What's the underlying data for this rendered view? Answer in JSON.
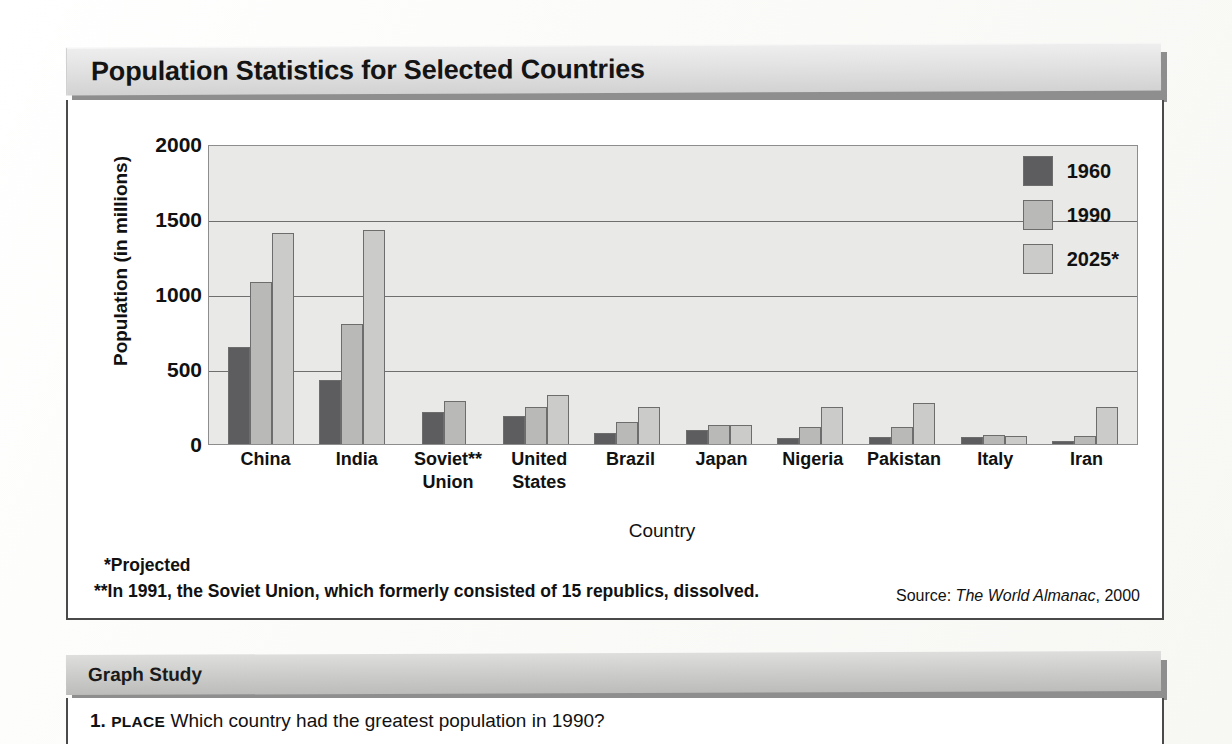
{
  "header": {
    "title": "Population Statistics for Selected Countries"
  },
  "chart_data": {
    "type": "bar",
    "title": "Population Statistics for Selected Countries",
    "xlabel": "Country",
    "ylabel": "Population (in millions)",
    "ylim": [
      0,
      2000
    ],
    "yticks": [
      2000,
      1500,
      1000,
      500,
      0
    ],
    "gridlines": [
      1500,
      1000,
      500
    ],
    "grid": true,
    "legend_position": "top-right",
    "categories": [
      "China",
      "India",
      "Soviet** Union",
      "United States",
      "Brazil",
      "Japan",
      "Nigeria",
      "Pakistan",
      "Italy",
      "Iran"
    ],
    "category_lines": [
      [
        "China"
      ],
      [
        "India"
      ],
      [
        "Soviet**",
        "Union"
      ],
      [
        "United",
        "States"
      ],
      [
        "Brazil"
      ],
      [
        "Japan"
      ],
      [
        "Nigeria"
      ],
      [
        "Pakistan"
      ],
      [
        "Italy"
      ],
      [
        "Iran"
      ]
    ],
    "series": [
      {
        "name": "1960",
        "color": "#5d5d5f",
        "values": [
          650,
          430,
          215,
          185,
          73,
          94,
          42,
          50,
          50,
          22
        ]
      },
      {
        "name": "1990",
        "color": "#b9b9b7",
        "values": [
          1080,
          800,
          290,
          250,
          150,
          124,
          115,
          113,
          58,
          56
        ]
      },
      {
        "name": "2025*",
        "color": "#cbcbc9",
        "values": [
          1410,
          1430,
          null,
          330,
          245,
          126,
          246,
          276,
          55,
          244
        ]
      }
    ]
  },
  "notes": {
    "projected": "*Projected",
    "soviet": "**In 1991, the Soviet Union, which formerly consisted of 15 republics, dissolved."
  },
  "source": {
    "prefix": "Source:",
    "title": "The World Almanac",
    "year": ", 2000"
  },
  "graph_study": {
    "heading": "Graph Study",
    "question_number": "1.",
    "question_tag": "PLACE",
    "question_text": "Which country had the greatest population in 1990?"
  }
}
